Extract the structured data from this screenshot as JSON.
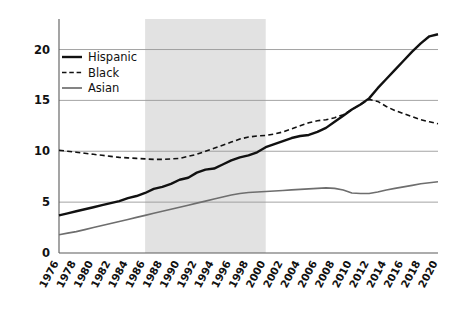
{
  "chart_data": {
    "type": "line",
    "title": "",
    "subtitle": "",
    "xlabel": "",
    "ylabel": "",
    "xlim": [
      1976,
      2020
    ],
    "ylim": [
      0,
      23
    ],
    "grid": true,
    "legend_position": "top-left inside plot",
    "y_ticks": [
      0,
      5,
      10,
      15,
      20
    ],
    "y_tick_labels": [
      "0",
      "5",
      "10",
      "15",
      "20"
    ],
    "x_ticks": [
      1976,
      1978,
      1980,
      1982,
      1984,
      1986,
      1988,
      1990,
      1992,
      1994,
      1996,
      1998,
      2000,
      2002,
      2004,
      2006,
      2008,
      2010,
      2012,
      2014,
      2016,
      2018,
      2020
    ],
    "x_tick_labels": [
      "1976",
      "1978",
      "1980",
      "1982",
      "1984",
      "1986",
      "1988",
      "1990",
      "1992",
      "1994",
      "1996",
      "1998",
      "2000",
      "2002",
      "2004",
      "2006",
      "2008",
      "2010",
      "2012",
      "2014",
      "2016",
      "2018",
      "2020"
    ],
    "x": [
      1976,
      1977,
      1978,
      1979,
      1980,
      1981,
      1982,
      1983,
      1984,
      1985,
      1986,
      1987,
      1988,
      1989,
      1990,
      1991,
      1992,
      1993,
      1994,
      1995,
      1996,
      1997,
      1998,
      1999,
      2000,
      2001,
      2002,
      2003,
      2004,
      2005,
      2006,
      2007,
      2008,
      2009,
      2010,
      2011,
      2012,
      2013,
      2014,
      2015,
      2016,
      2017,
      2018,
      2019,
      2020
    ],
    "series": [
      {
        "name": "Hispanic",
        "style": "solid",
        "color": "#111111",
        "width": 2.4,
        "values": [
          3.7,
          3.9,
          4.1,
          4.3,
          4.5,
          4.7,
          4.9,
          5.1,
          5.4,
          5.6,
          5.9,
          6.3,
          6.5,
          6.8,
          7.2,
          7.4,
          7.9,
          8.2,
          8.3,
          8.7,
          9.1,
          9.4,
          9.6,
          9.9,
          10.4,
          10.7,
          11.0,
          11.3,
          11.5,
          11.6,
          11.9,
          12.3,
          12.9,
          13.5,
          14.1,
          14.6,
          15.2,
          16.2,
          17.1,
          18.0,
          18.9,
          19.8,
          20.6,
          21.3,
          21.5
        ]
      },
      {
        "name": "Black",
        "style": "dashed",
        "color": "#111111",
        "width": 1.6,
        "values": [
          10.1,
          10.0,
          9.9,
          9.8,
          9.7,
          9.6,
          9.5,
          9.4,
          9.35,
          9.3,
          9.25,
          9.2,
          9.2,
          9.25,
          9.3,
          9.5,
          9.7,
          10.0,
          10.3,
          10.6,
          10.9,
          11.2,
          11.4,
          11.5,
          11.55,
          11.7,
          11.9,
          12.2,
          12.5,
          12.8,
          13.0,
          13.1,
          13.3,
          13.6,
          14.1,
          14.6,
          15.1,
          14.9,
          14.4,
          14.0,
          13.7,
          13.4,
          13.1,
          12.9,
          12.7
        ]
      },
      {
        "name": "Asian",
        "style": "solid",
        "color": "#6e6e6e",
        "width": 1.6,
        "values": [
          1.8,
          1.95,
          2.1,
          2.3,
          2.5,
          2.7,
          2.9,
          3.1,
          3.3,
          3.5,
          3.7,
          3.9,
          4.1,
          4.3,
          4.5,
          4.7,
          4.9,
          5.1,
          5.3,
          5.5,
          5.7,
          5.85,
          5.95,
          6.0,
          6.05,
          6.1,
          6.15,
          6.2,
          6.25,
          6.3,
          6.35,
          6.4,
          6.35,
          6.2,
          5.9,
          5.85,
          5.85,
          6.0,
          6.2,
          6.35,
          6.5,
          6.65,
          6.8,
          6.9,
          7.0
        ]
      }
    ],
    "shaded_region": {
      "start": 1986,
      "end": 2000,
      "color": "#e2e2e2"
    },
    "legend": [
      {
        "label": "Hispanic",
        "style": "solid",
        "color": "#111111"
      },
      {
        "label": "Black",
        "style": "dashed",
        "color": "#111111"
      },
      {
        "label": "Asian",
        "style": "solid",
        "color": "#6e6e6e"
      }
    ]
  }
}
